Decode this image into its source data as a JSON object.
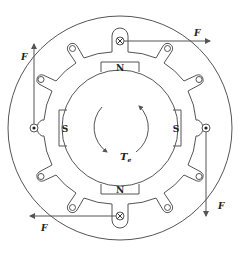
{
  "diagram": {
    "type": "motor-cross-section",
    "colors": {
      "line": "#555555",
      "text": "#222222",
      "background": "#ffffff"
    },
    "poles": {
      "top": "N",
      "bottom": "N",
      "left": "S",
      "right": "S"
    },
    "torque_label": "T",
    "torque_subscript": "e",
    "forces": {
      "top_right": "F",
      "left_up": "F",
      "bottom_left": "F",
      "right_down": "F"
    },
    "conductors": {
      "top": "cross",
      "bottom": "cross",
      "left": "dot",
      "right": "dot"
    }
  }
}
